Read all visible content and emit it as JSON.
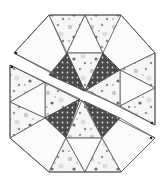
{
  "diagram": {
    "colors": {
      "background": "#ffffff",
      "outline": "#555555",
      "dark_fabric": "#4a4a4a",
      "dark_fabric_dot": "#d8d8d8",
      "light_fabric": "#f6f6f6",
      "light_fabric_dots": [
        "#c8c8c8",
        "#9a9a9a",
        "#6e6e6e",
        "#dddddd"
      ]
    },
    "pieces": [
      {
        "name": "upper-half",
        "fabric": "mixed"
      },
      {
        "name": "lower-half",
        "fabric": "mixed"
      }
    ],
    "marker_dots": 4,
    "dark_triangles": 4
  }
}
